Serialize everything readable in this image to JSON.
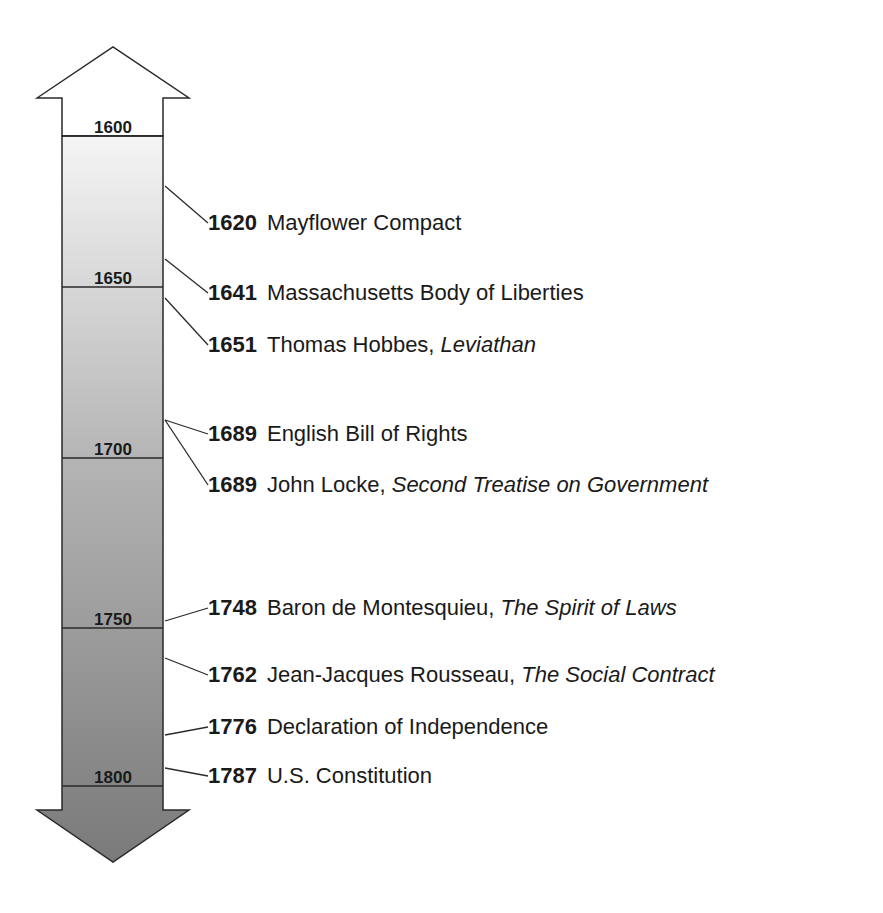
{
  "diagram": {
    "colors": {
      "top": "#f4f4f4",
      "bottom": "#7d7d7d",
      "line": "#2a2a2a"
    },
    "ticks": [
      {
        "label": "1600",
        "y": 136
      },
      {
        "label": "1650",
        "y": 287
      },
      {
        "label": "1700",
        "y": 458
      },
      {
        "label": "1750",
        "y": 628
      },
      {
        "label": "1800",
        "y": 786
      }
    ],
    "events": [
      {
        "year": "1620",
        "text": "Mayflower Compact",
        "italic": "",
        "y": 223,
        "ay": 186
      },
      {
        "year": "1641",
        "text": "Massachusetts Body of Liberties",
        "italic": "",
        "y": 293,
        "ay": 259
      },
      {
        "year": "1651",
        "text": "Thomas Hobbes, ",
        "italic": "Leviathan",
        "y": 345,
        "ay": 298
      },
      {
        "year": "1689",
        "text": "English Bill of Rights",
        "italic": "",
        "y": 434,
        "ay": 420
      },
      {
        "year": "1689",
        "text": "John Locke, ",
        "italic": "Second Treatise on Government",
        "y": 485,
        "ay": 420
      },
      {
        "year": "1748",
        "text": "Baron de Montesquieu, ",
        "italic": "The Spirit of Laws",
        "y": 608,
        "ay": 621
      },
      {
        "year": "1762",
        "text": "Jean-Jacques Rousseau, ",
        "italic": "The Social Contract",
        "y": 675,
        "ay": 658
      },
      {
        "year": "1776",
        "text": "Declaration of Independence",
        "italic": "",
        "y": 727,
        "ay": 735
      },
      {
        "year": "1787",
        "text": "U.S. Constitution",
        "italic": "",
        "y": 776,
        "ay": 768
      }
    ]
  }
}
